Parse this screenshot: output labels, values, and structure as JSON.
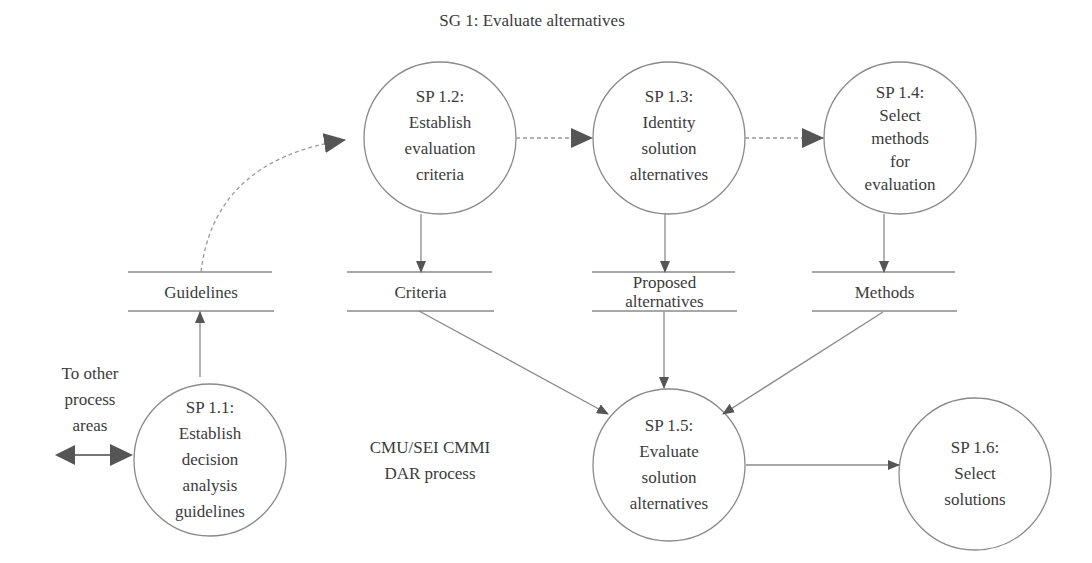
{
  "title": "SG 1: Evaluate alternatives",
  "caption": [
    "CMU/SEI CMMI",
    "DAR process"
  ],
  "external": {
    "label": [
      "To other",
      "process",
      "areas"
    ]
  },
  "processes": [
    {
      "id": "sp11",
      "code": "SP 1.1:",
      "lines": [
        "Establish",
        "decision",
        "analysis",
        "guidelines"
      ]
    },
    {
      "id": "sp12",
      "code": "SP 1.2:",
      "lines": [
        "Establish",
        "evaluation",
        "criteria"
      ]
    },
    {
      "id": "sp13",
      "code": "SP 1.3:",
      "lines": [
        "Identity",
        "solution",
        "alternatives"
      ]
    },
    {
      "id": "sp14",
      "code": "SP 1.4:",
      "lines": [
        "Select",
        "methods",
        "for",
        "evaluation"
      ]
    },
    {
      "id": "sp15",
      "code": "SP 1.5:",
      "lines": [
        "Evaluate",
        "solution",
        "alternatives"
      ]
    },
    {
      "id": "sp16",
      "code": "SP 1.6:",
      "lines": [
        "Select",
        "solutions"
      ]
    }
  ],
  "stores": [
    {
      "id": "guidelines",
      "lines": [
        "Guidelines"
      ]
    },
    {
      "id": "criteria",
      "lines": [
        "Criteria"
      ]
    },
    {
      "id": "proposed",
      "lines": [
        "Proposed",
        "alternatives"
      ]
    },
    {
      "id": "methods",
      "lines": [
        "Methods"
      ]
    }
  ],
  "colors": {
    "stroke": "#8a8a8a",
    "arrow": "#555555",
    "text": "#3b3b3b"
  }
}
